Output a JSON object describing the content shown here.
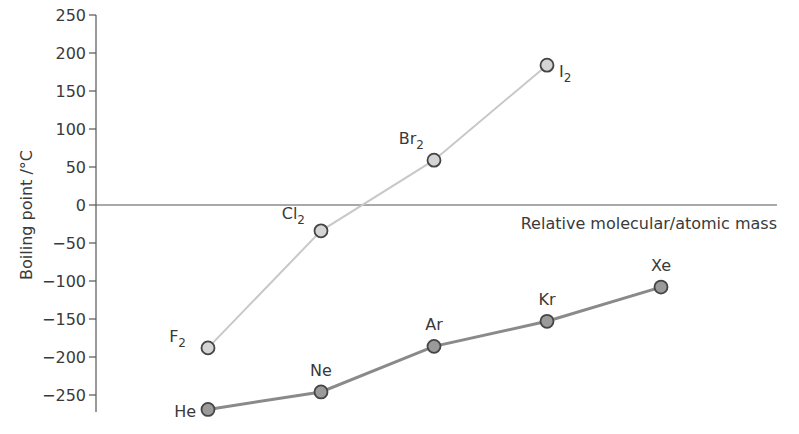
{
  "chart_data": {
    "type": "line",
    "title": "",
    "xlabel": "Relative molecular/atomic mass",
    "ylabel": "Boiling point /°C",
    "ylim": [
      -275,
      250
    ],
    "yticks": [
      250,
      200,
      150,
      100,
      50,
      0,
      -50,
      -100,
      -150,
      -200,
      -250
    ],
    "grid": false,
    "legend": "none (points labelled directly)",
    "series": [
      {
        "name": "Halogens",
        "color": "#c8c8c8",
        "marker_fill": "#d4d4d4",
        "points": [
          {
            "label": "F",
            "sub": "2",
            "x_index": 0,
            "y": -188
          },
          {
            "label": "Cl",
            "sub": "2",
            "x_index": 1,
            "y": -34
          },
          {
            "label": "Br",
            "sub": "2",
            "x_index": 2,
            "y": 59
          },
          {
            "label": "I",
            "sub": "2",
            "x_index": 3,
            "y": 184
          }
        ]
      },
      {
        "name": "Noble gases",
        "color": "#8a8a8a",
        "marker_fill": "#9a9a9a",
        "points": [
          {
            "label": "He",
            "sub": "",
            "x_index": 0,
            "y": -269
          },
          {
            "label": "Ne",
            "sub": "",
            "x_index": 1,
            "y": -246
          },
          {
            "label": "Ar",
            "sub": "",
            "x_index": 2,
            "y": -186
          },
          {
            "label": "Kr",
            "sub": "",
            "x_index": 3,
            "y": -153
          },
          {
            "label": "Xe",
            "sub": "",
            "x_index": 4,
            "y": -108
          }
        ]
      }
    ]
  },
  "labels": {
    "ylabel": "Boiling point /°C",
    "xlabel": "Relative molecular/atomic mass"
  }
}
